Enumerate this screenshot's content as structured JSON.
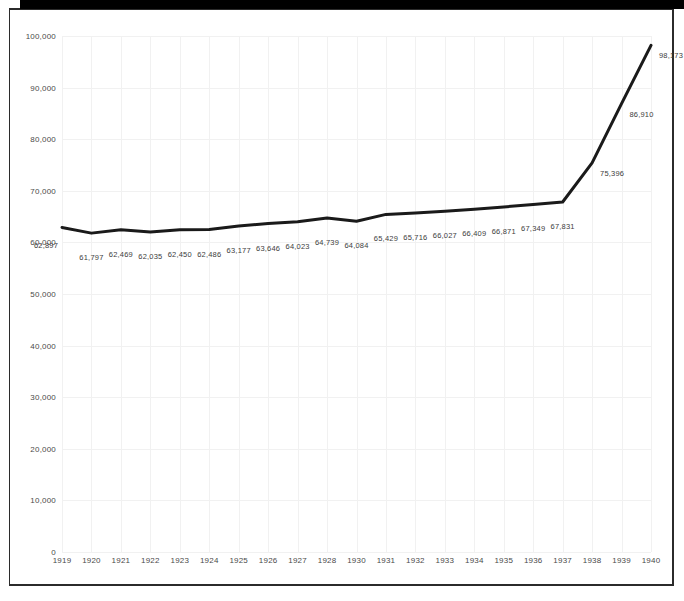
{
  "chart_data": {
    "type": "line",
    "title": "",
    "subtitle": "",
    "xlabel": "",
    "ylabel": "",
    "categories": [
      "1919",
      "1920",
      "1921",
      "1922",
      "1923",
      "1924",
      "1925",
      "1926",
      "1927",
      "1928",
      "1930",
      "1931",
      "1932",
      "1933",
      "1934",
      "1935",
      "1936",
      "1937",
      "1938",
      "1939",
      "1940"
    ],
    "values": [
      62897,
      61797,
      62469,
      62035,
      62450,
      62486,
      63177,
      63646,
      64023,
      64739,
      64084,
      65429,
      65716,
      66027,
      66409,
      66871,
      67349,
      67831,
      75396,
      86910,
      98173
    ],
    "point_labels": [
      "62,897",
      "61,797",
      "62,469",
      "62,035",
      "62,450",
      "62,486",
      "63,177",
      "63,646",
      "64,023",
      "64,739",
      "64,084",
      "65,429",
      "65,716",
      "66,027",
      "66,409",
      "66,871",
      "67,349",
      "67,831",
      "75,396",
      "86,910",
      "98,173"
    ],
    "ylim": [
      0,
      100000
    ],
    "yticks": [
      0,
      10000,
      20000,
      30000,
      40000,
      50000,
      60000,
      70000,
      80000,
      90000,
      100000
    ],
    "ytick_labels": [
      "0",
      "10,000",
      "20,000",
      "30,000",
      "40,000",
      "50,000",
      "60,000",
      "70,000",
      "80,000",
      "90,000",
      "100,000"
    ],
    "grid": true,
    "legend": false,
    "legend_position": "none",
    "series_color": "#1a1a1a",
    "grid_color": "#f1f1f1",
    "label_color": "#4a4a4a",
    "line_width": 3
  },
  "figure": {
    "background_color": "#ffffff",
    "border_color": "#2b2b2b",
    "top_bar_color": "#000000"
  }
}
